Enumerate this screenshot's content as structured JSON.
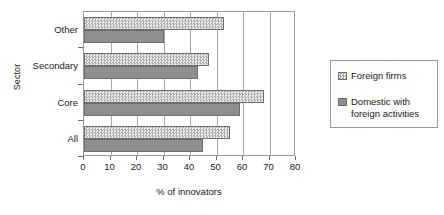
{
  "chart_data": {
    "type": "bar",
    "orientation": "horizontal",
    "title": "",
    "xlabel": "% of innovators",
    "ylabel": "Sector",
    "xlim": [
      0,
      80
    ],
    "xticks": [
      0,
      10,
      20,
      30,
      40,
      50,
      60,
      70,
      80
    ],
    "grid": true,
    "legend_position": "right",
    "categories": [
      "Other",
      "Secondary",
      "Core",
      "All"
    ],
    "series": [
      {
        "name": "Foreign firms",
        "pattern": "checkered",
        "color": "#c9c9c9",
        "values": [
          53,
          47,
          68,
          55
        ]
      },
      {
        "name": "Domestic with foreign activities",
        "pattern": "solid",
        "color": "#8f8f8f",
        "values": [
          30,
          43,
          59,
          45
        ]
      }
    ]
  },
  "legend": {
    "entries": [
      {
        "label": "Foreign firms",
        "swatch": "checkered-swatch-icon"
      },
      {
        "label": "Domestic with foreign activities",
        "swatch": "solid-gray-swatch-icon"
      }
    ]
  }
}
